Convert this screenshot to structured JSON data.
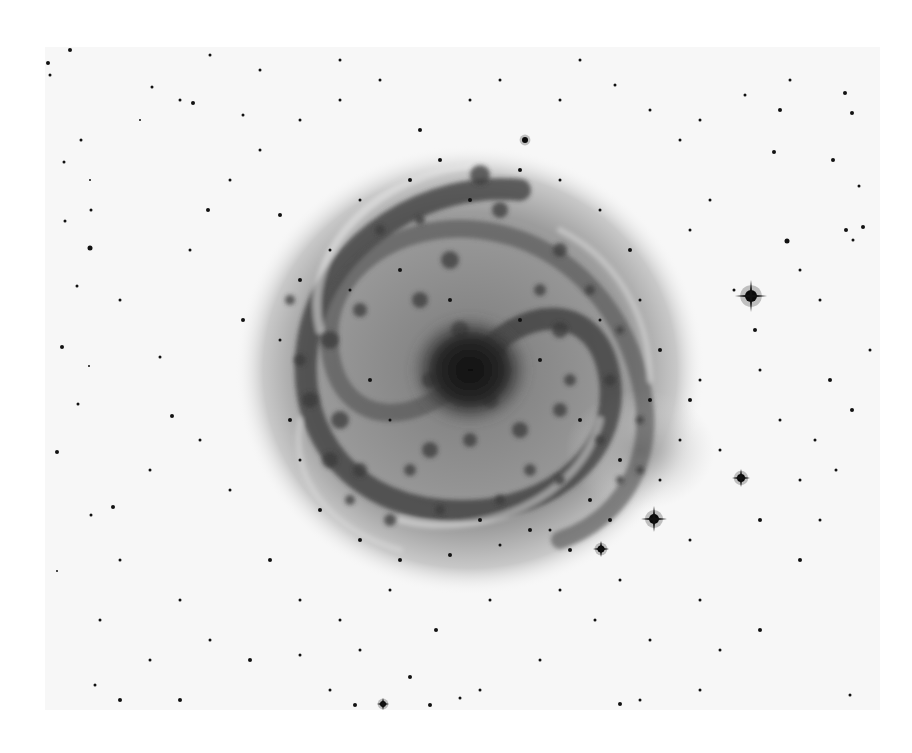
{
  "image": {
    "subject": "Inverted (negative) photographic plate of a face-on spiral galaxy with surrounding field stars",
    "background_color": "#ffffff",
    "plate": {
      "x": 45,
      "y": 47,
      "width": 835,
      "height": 663,
      "tone": "#f7f7f7"
    },
    "galaxy": {
      "center": [
        470,
        370
      ],
      "halo_rx": 235,
      "halo_ry": 225,
      "disk_rx": 205,
      "disk_ry": 200,
      "core_rx": 60,
      "core_ry": 55,
      "halo_color": "#cfcfcf",
      "disk_color": "#8f8f8f",
      "arm_color": "#3a3a3a",
      "core_color": "#141414",
      "outer_arm": {
        "cx": 640,
        "cy": 450,
        "rx": 75,
        "ry": 60,
        "color": "#9a9a9a"
      }
    },
    "bright_stars": [
      {
        "x": 751,
        "y": 296,
        "r": 6,
        "spike": 16
      },
      {
        "x": 654,
        "y": 519,
        "r": 5,
        "spike": 13
      },
      {
        "x": 741,
        "y": 478,
        "r": 4,
        "spike": 9
      },
      {
        "x": 601,
        "y": 549,
        "r": 3.5,
        "spike": 8
      },
      {
        "x": 525,
        "y": 140,
        "r": 3,
        "spike": 0
      },
      {
        "x": 383,
        "y": 704,
        "r": 3,
        "spike": 6
      }
    ],
    "stars": [
      [
        70,
        50,
        2
      ],
      [
        48,
        63,
        2
      ],
      [
        50,
        75,
        1.5
      ],
      [
        152,
        87,
        1.5
      ],
      [
        180,
        100,
        1.5
      ],
      [
        193,
        103,
        2
      ],
      [
        243,
        115,
        1.5
      ],
      [
        81,
        140,
        1.5
      ],
      [
        64,
        162,
        1.5
      ],
      [
        90,
        180,
        1
      ],
      [
        91,
        210,
        1.5
      ],
      [
        65,
        221,
        1.5
      ],
      [
        90,
        248,
        2.5
      ],
      [
        77,
        286,
        1.5
      ],
      [
        62,
        347,
        2
      ],
      [
        89,
        366,
        1
      ],
      [
        78,
        404,
        1.5
      ],
      [
        57,
        452,
        2
      ],
      [
        91,
        515,
        1.5
      ],
      [
        57,
        571,
        1
      ],
      [
        113,
        507,
        2
      ],
      [
        172,
        416,
        2
      ],
      [
        160,
        357,
        1.5
      ],
      [
        243,
        320,
        2
      ],
      [
        200,
        440,
        1.5
      ],
      [
        230,
        490,
        1.5
      ],
      [
        120,
        560,
        1.5
      ],
      [
        180,
        600,
        1.5
      ],
      [
        210,
        640,
        1.5
      ],
      [
        150,
        660,
        1.5
      ],
      [
        95,
        685,
        1.5
      ],
      [
        120,
        700,
        2
      ],
      [
        180,
        700,
        2
      ],
      [
        330,
        690,
        1.5
      ],
      [
        355,
        705,
        2
      ],
      [
        410,
        677,
        2
      ],
      [
        436,
        630,
        2
      ],
      [
        480,
        690,
        1.5
      ],
      [
        540,
        660,
        1.5
      ],
      [
        595,
        620,
        1.5
      ],
      [
        650,
        640,
        1.5
      ],
      [
        700,
        600,
        1.5
      ],
      [
        720,
        650,
        1.5
      ],
      [
        760,
        630,
        2
      ],
      [
        800,
        560,
        2
      ],
      [
        820,
        520,
        1.5
      ],
      [
        836,
        470,
        1.5
      ],
      [
        852,
        410,
        2
      ],
      [
        870,
        350,
        1.5
      ],
      [
        853,
        240,
        1.5
      ],
      [
        846,
        230,
        2
      ],
      [
        863,
        227,
        2
      ],
      [
        859,
        186,
        1.5
      ],
      [
        833,
        160,
        2
      ],
      [
        852,
        113,
        2
      ],
      [
        845,
        93,
        2
      ],
      [
        787,
        241,
        2.5
      ],
      [
        774,
        152,
        2
      ],
      [
        734,
        290,
        1.5
      ],
      [
        755,
        330,
        2
      ],
      [
        760,
        370,
        1.5
      ],
      [
        780,
        420,
        1.5
      ],
      [
        720,
        450,
        1.5
      ],
      [
        700,
        380,
        1.5
      ],
      [
        690,
        230,
        1.5
      ],
      [
        710,
        200,
        1.5
      ],
      [
        680,
        140,
        1.5
      ],
      [
        650,
        110,
        1.5
      ],
      [
        615,
        85,
        1.5
      ],
      [
        580,
        60,
        1.5
      ],
      [
        560,
        100,
        1.5
      ],
      [
        500,
        80,
        1.5
      ],
      [
        470,
        100,
        1.5
      ],
      [
        420,
        130,
        2
      ],
      [
        380,
        80,
        1.5
      ],
      [
        340,
        100,
        1.5
      ],
      [
        300,
        120,
        1.5
      ],
      [
        260,
        150,
        1.5
      ],
      [
        230,
        180,
        1.5
      ],
      [
        208,
        210,
        2
      ],
      [
        190,
        250,
        1.5
      ],
      [
        280,
        215,
        2
      ],
      [
        340,
        60,
        1.5
      ],
      [
        260,
        70,
        1.5
      ],
      [
        210,
        55,
        1.5
      ],
      [
        140,
        120,
        1
      ],
      [
        120,
        300,
        1.5
      ],
      [
        150,
        470,
        1.5
      ],
      [
        270,
        560,
        2
      ],
      [
        300,
        600,
        1.5
      ],
      [
        340,
        620,
        1.5
      ],
      [
        390,
        590,
        1.5
      ],
      [
        490,
        600,
        1.5
      ],
      [
        560,
        590,
        1.5
      ],
      [
        620,
        580,
        1.5
      ],
      [
        690,
        540,
        1.5
      ],
      [
        760,
        520,
        2
      ],
      [
        800,
        480,
        1.5
      ],
      [
        815,
        440,
        1.5
      ],
      [
        830,
        380,
        2
      ],
      [
        820,
        300,
        1.5
      ],
      [
        800,
        270,
        1.5
      ],
      [
        700,
        120,
        1.5
      ],
      [
        745,
        95,
        1.5
      ],
      [
        790,
        80,
        1.5
      ],
      [
        780,
        110,
        2
      ],
      [
        430,
        705,
        2
      ],
      [
        460,
        698,
        1.5
      ],
      [
        620,
        704,
        2
      ],
      [
        640,
        700,
        1.5
      ],
      [
        700,
        690,
        1.5
      ],
      [
        850,
        695,
        1.5
      ],
      [
        100,
        620,
        1.5
      ],
      [
        250,
        660,
        2
      ],
      [
        300,
        655,
        1.5
      ],
      [
        360,
        650,
        1.5
      ]
    ],
    "galaxy_knots": [
      [
        480,
        175,
        10
      ],
      [
        500,
        210,
        8
      ],
      [
        560,
        250,
        7
      ],
      [
        450,
        260,
        9
      ],
      [
        420,
        300,
        8
      ],
      [
        360,
        310,
        7
      ],
      [
        330,
        340,
        9
      ],
      [
        300,
        360,
        6
      ],
      [
        310,
        400,
        8
      ],
      [
        340,
        420,
        9
      ],
      [
        330,
        460,
        8
      ],
      [
        360,
        470,
        7
      ],
      [
        410,
        470,
        6
      ],
      [
        430,
        450,
        8
      ],
      [
        470,
        440,
        7
      ],
      [
        520,
        430,
        8
      ],
      [
        560,
        410,
        7
      ],
      [
        570,
        380,
        6
      ],
      [
        560,
        330,
        8
      ],
      [
        540,
        290,
        6
      ],
      [
        590,
        290,
        5
      ],
      [
        610,
        380,
        6
      ],
      [
        600,
        440,
        5
      ],
      [
        530,
        470,
        6
      ],
      [
        500,
        500,
        5
      ],
      [
        440,
        510,
        5
      ],
      [
        390,
        520,
        6
      ],
      [
        350,
        500,
        5
      ],
      [
        290,
        300,
        5
      ],
      [
        380,
        230,
        5
      ],
      [
        420,
        220,
        5
      ],
      [
        620,
        330,
        4
      ],
      [
        640,
        420,
        4
      ],
      [
        460,
        330,
        9
      ],
      [
        430,
        380,
        8
      ],
      [
        500,
        350,
        7
      ],
      [
        490,
        400,
        8
      ],
      [
        560,
        480,
        5
      ],
      [
        620,
        480,
        4
      ],
      [
        640,
        470,
        4
      ]
    ],
    "galaxy_stars": [
      [
        410,
        180,
        2
      ],
      [
        440,
        160,
        2
      ],
      [
        520,
        170,
        2
      ],
      [
        360,
        200,
        1.5
      ],
      [
        330,
        250,
        1.5
      ],
      [
        300,
        280,
        2
      ],
      [
        280,
        340,
        1.5
      ],
      [
        290,
        420,
        2
      ],
      [
        300,
        460,
        1.5
      ],
      [
        320,
        510,
        2
      ],
      [
        360,
        540,
        2
      ],
      [
        400,
        560,
        2
      ],
      [
        450,
        555,
        2
      ],
      [
        500,
        545,
        1.5
      ],
      [
        550,
        530,
        1.5
      ],
      [
        590,
        500,
        2
      ],
      [
        620,
        460,
        2
      ],
      [
        650,
        400,
        2
      ],
      [
        660,
        350,
        2
      ],
      [
        640,
        300,
        1.5
      ],
      [
        630,
        250,
        2
      ],
      [
        600,
        210,
        1.5
      ],
      [
        560,
        180,
        1.5
      ],
      [
        470,
        200,
        2
      ],
      [
        400,
        270,
        2
      ],
      [
        350,
        290,
        1.5
      ],
      [
        370,
        380,
        2
      ],
      [
        390,
        420,
        1.5
      ],
      [
        450,
        300,
        2
      ],
      [
        520,
        320,
        2
      ],
      [
        540,
        360,
        2
      ],
      [
        600,
        320,
        1.5
      ],
      [
        580,
        420,
        2
      ],
      [
        530,
        530,
        2
      ],
      [
        570,
        550,
        2
      ],
      [
        680,
        440,
        1.5
      ],
      [
        690,
        400,
        2
      ],
      [
        660,
        480,
        1.5
      ],
      [
        610,
        520,
        2
      ],
      [
        480,
        520,
        2
      ]
    ]
  }
}
